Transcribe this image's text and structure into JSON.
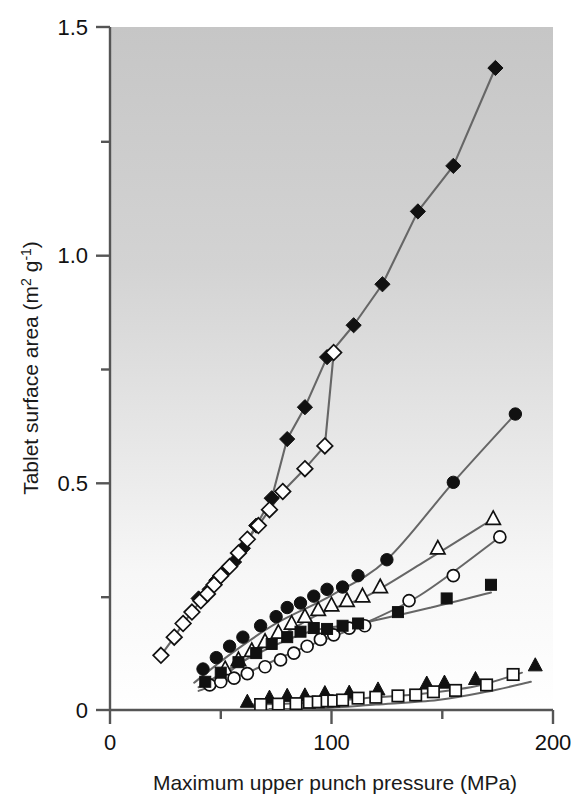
{
  "figure": {
    "background_top": "#c9c9c9",
    "background_bottom": "#ffffff",
    "line_color": "#666666",
    "marker_color": "#111111",
    "axis_color": "#555555"
  },
  "axes": {
    "x_label": "Maximum upper punch pressure (MPa)",
    "y_label_main": "Tablet surface area (m",
    "y_label_sup1": "2",
    "y_label_mid": " g",
    "y_label_sup2": "-1",
    "y_label_end": ")",
    "x_ticks": [
      "0",
      "100",
      "200"
    ],
    "y_ticks": [
      "0",
      "0.5",
      "1.0",
      "1.5"
    ]
  },
  "chart_data": {
    "type": "scatter",
    "title": "",
    "xlabel": "Maximum upper punch pressure (MPa)",
    "ylabel": "Tablet surface area (m2 g-1)",
    "xlim": [
      0,
      200
    ],
    "ylim": [
      0,
      1.5
    ],
    "xticks": [
      0,
      100,
      200
    ],
    "xminorticks": [
      50,
      150
    ],
    "yticks": [
      0,
      0.5,
      1.0,
      1.5
    ],
    "yminorticks": [
      0.25,
      0.75,
      1.25
    ],
    "grid": false,
    "legend": "none",
    "series": [
      {
        "name": "filled-diamond",
        "marker": "diamond-filled",
        "points": [
          [
            40,
            0.245
          ],
          [
            45,
            0.265
          ],
          [
            48,
            0.285
          ],
          [
            52,
            0.305
          ],
          [
            56,
            0.325
          ],
          [
            60,
            0.355
          ],
          [
            66,
            0.405
          ],
          [
            73,
            0.465
          ],
          [
            80,
            0.595
          ],
          [
            88,
            0.665
          ],
          [
            98,
            0.775
          ],
          [
            110,
            0.845
          ],
          [
            123,
            0.935
          ],
          [
            139,
            1.095
          ],
          [
            155,
            1.195
          ],
          [
            174,
            1.41
          ]
        ]
      },
      {
        "name": "open-diamond",
        "marker": "diamond-open",
        "points": [
          [
            23,
            0.12
          ],
          [
            29,
            0.16
          ],
          [
            33,
            0.19
          ],
          [
            37,
            0.215
          ],
          [
            41,
            0.24
          ],
          [
            44,
            0.255
          ],
          [
            47,
            0.275
          ],
          [
            50,
            0.295
          ],
          [
            54,
            0.315
          ],
          [
            58,
            0.345
          ],
          [
            62,
            0.375
          ],
          [
            67,
            0.405
          ],
          [
            72,
            0.44
          ],
          [
            78,
            0.48
          ],
          [
            88,
            0.53
          ],
          [
            97,
            0.58
          ],
          [
            101,
            0.785
          ]
        ]
      },
      {
        "name": "filled-circle",
        "marker": "circle-filled",
        "points": [
          [
            42,
            0.09
          ],
          [
            48,
            0.115
          ],
          [
            54,
            0.14
          ],
          [
            60,
            0.16
          ],
          [
            68,
            0.185
          ],
          [
            75,
            0.205
          ],
          [
            80,
            0.225
          ],
          [
            86,
            0.235
          ],
          [
            92,
            0.25
          ],
          [
            98,
            0.265
          ],
          [
            105,
            0.27
          ],
          [
            112,
            0.295
          ],
          [
            125,
            0.33
          ],
          [
            155,
            0.5
          ],
          [
            183,
            0.65
          ]
        ]
      },
      {
        "name": "open-triangle",
        "marker": "triangle-open",
        "points": [
          [
            52,
            0.09
          ],
          [
            58,
            0.11
          ],
          [
            64,
            0.13
          ],
          [
            70,
            0.15
          ],
          [
            76,
            0.17
          ],
          [
            82,
            0.19
          ],
          [
            88,
            0.205
          ],
          [
            94,
            0.22
          ],
          [
            100,
            0.23
          ],
          [
            107,
            0.24
          ],
          [
            114,
            0.25
          ],
          [
            122,
            0.27
          ],
          [
            148,
            0.355
          ],
          [
            173,
            0.42
          ]
        ]
      },
      {
        "name": "open-circle",
        "marker": "circle-open",
        "points": [
          [
            45,
            0.055
          ],
          [
            50,
            0.062
          ],
          [
            56,
            0.07
          ],
          [
            62,
            0.08
          ],
          [
            70,
            0.095
          ],
          [
            77,
            0.11
          ],
          [
            83,
            0.125
          ],
          [
            89,
            0.14
          ],
          [
            95,
            0.155
          ],
          [
            101,
            0.165
          ],
          [
            108,
            0.18
          ],
          [
            115,
            0.185
          ],
          [
            135,
            0.24
          ],
          [
            155,
            0.295
          ],
          [
            176,
            0.38
          ]
        ]
      },
      {
        "name": "filled-square",
        "marker": "square-filled",
        "points": [
          [
            43,
            0.062
          ],
          [
            50,
            0.082
          ],
          [
            58,
            0.105
          ],
          [
            66,
            0.125
          ],
          [
            73,
            0.145
          ],
          [
            80,
            0.16
          ],
          [
            86,
            0.172
          ],
          [
            92,
            0.18
          ],
          [
            98,
            0.178
          ],
          [
            105,
            0.185
          ],
          [
            112,
            0.19
          ],
          [
            130,
            0.215
          ],
          [
            152,
            0.245
          ],
          [
            172,
            0.275
          ]
        ]
      },
      {
        "name": "filled-triangle",
        "marker": "triangle-filled",
        "points": [
          [
            62,
            0.018
          ],
          [
            72,
            0.027
          ],
          [
            80,
            0.031
          ],
          [
            88,
            0.032
          ],
          [
            97,
            0.037
          ],
          [
            108,
            0.038
          ],
          [
            121,
            0.045
          ],
          [
            143,
            0.058
          ],
          [
            151,
            0.06
          ],
          [
            165,
            0.068
          ],
          [
            192,
            0.098
          ]
        ]
      },
      {
        "name": "open-square",
        "marker": "square-open",
        "points": [
          [
            68,
            0.012
          ],
          [
            76,
            0.013
          ],
          [
            84,
            0.014
          ],
          [
            90,
            0.017
          ],
          [
            94,
            0.018
          ],
          [
            98,
            0.02
          ],
          [
            101,
            0.02
          ],
          [
            105,
            0.022
          ],
          [
            112,
            0.026
          ],
          [
            120,
            0.028
          ],
          [
            130,
            0.031
          ],
          [
            138,
            0.033
          ],
          [
            146,
            0.04
          ],
          [
            156,
            0.043
          ],
          [
            170,
            0.055
          ],
          [
            182,
            0.078
          ]
        ]
      }
    ],
    "guide_curves": [
      {
        "name": "filled-circle-trend",
        "points": [
          [
            38,
            0.06
          ],
          [
            55,
            0.125
          ],
          [
            75,
            0.19
          ],
          [
            100,
            0.252
          ],
          [
            125,
            0.33
          ],
          [
            155,
            0.5
          ],
          [
            183,
            0.65
          ]
        ]
      },
      {
        "name": "open-triangle-trend",
        "points": [
          [
            50,
            0.07
          ],
          [
            70,
            0.14
          ],
          [
            95,
            0.212
          ],
          [
            115,
            0.248
          ],
          [
            140,
            0.32
          ],
          [
            173,
            0.42
          ]
        ]
      },
      {
        "name": "open-circle-trend",
        "points": [
          [
            40,
            0.042
          ],
          [
            60,
            0.078
          ],
          [
            85,
            0.132
          ],
          [
            110,
            0.18
          ],
          [
            140,
            0.252
          ],
          [
            176,
            0.38
          ]
        ]
      },
      {
        "name": "filled-square-trend",
        "points": [
          [
            40,
            0.05
          ],
          [
            65,
            0.12
          ],
          [
            90,
            0.172
          ],
          [
            115,
            0.192
          ],
          [
            145,
            0.225
          ],
          [
            172,
            0.258
          ]
        ]
      },
      {
        "name": "open-square-trend",
        "points": [
          [
            64,
            0.012
          ],
          [
            90,
            0.016
          ],
          [
            115,
            0.026
          ],
          [
            140,
            0.035
          ],
          [
            165,
            0.052
          ],
          [
            186,
            0.082
          ]
        ]
      },
      {
        "name": "filled-triangle-trend",
        "points": [
          [
            72,
            0.002
          ],
          [
            95,
            0.004
          ],
          [
            120,
            0.012
          ],
          [
            148,
            0.022
          ],
          [
            170,
            0.04
          ],
          [
            190,
            0.062
          ]
        ]
      }
    ]
  }
}
